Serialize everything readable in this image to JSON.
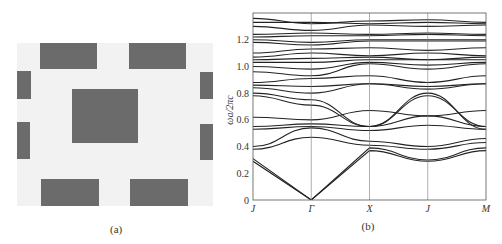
{
  "figure": {
    "panel_a": {
      "caption": "(a)",
      "description": "Unit cell of 2D photonic crystal with rectangular rods",
      "colors": {
        "background": "#f2f2f2",
        "rod": "#6b6b6b"
      },
      "rods": [
        {
          "name": "top-left",
          "x": 40,
          "y": 43,
          "w": 57,
          "h": 26
        },
        {
          "name": "top-right",
          "x": 129,
          "y": 43,
          "w": 57,
          "h": 26
        },
        {
          "name": "left-upper",
          "x": 17,
          "y": 71,
          "w": 14,
          "h": 28
        },
        {
          "name": "left-lower",
          "x": 17,
          "y": 122,
          "w": 13,
          "h": 37
        },
        {
          "name": "right-upper",
          "x": 200,
          "y": 72,
          "w": 13,
          "h": 27
        },
        {
          "name": "right-lower",
          "x": 200,
          "y": 124,
          "w": 13,
          "h": 36
        },
        {
          "name": "center",
          "x": 72,
          "y": 89,
          "w": 66,
          "h": 54
        },
        {
          "name": "bottom-left",
          "x": 41,
          "y": 179,
          "w": 58,
          "h": 27
        },
        {
          "name": "bottom-right",
          "x": 130,
          "y": 179,
          "w": 58,
          "h": 27
        }
      ]
    },
    "panel_b": {
      "caption": "(b)"
    }
  },
  "chart_data": {
    "type": "line",
    "title": "",
    "xlabel": "",
    "ylabel": "ωa/2πc",
    "categories": [
      "J",
      "Γ",
      "X",
      "J",
      "M"
    ],
    "yticks": [
      0,
      0.2,
      0.4,
      0.6,
      0.8,
      1.0,
      1.2
    ],
    "ytick_labels": [
      "0",
      "0.2",
      "0.4",
      "0.6",
      "0.8",
      "1.0",
      "1.2"
    ],
    "ylim": [
      0,
      1.4
    ],
    "grid": "vertical lines at high-symmetry points",
    "legend": "none",
    "series": [
      {
        "name": "band-1",
        "values": [
          0.29,
          0.0,
          0.37,
          0.29,
          0.37
        ]
      },
      {
        "name": "band-2",
        "values": [
          0.31,
          0.0,
          0.39,
          0.3,
          0.39
        ]
      },
      {
        "name": "band-3",
        "values": [
          0.38,
          0.47,
          0.41,
          0.38,
          0.43
        ]
      },
      {
        "name": "band-4",
        "values": [
          0.4,
          0.54,
          0.44,
          0.4,
          0.46
        ]
      },
      {
        "name": "band-5",
        "values": [
          0.53,
          0.55,
          0.52,
          0.56,
          0.53
        ]
      },
      {
        "name": "band-6",
        "values": [
          0.55,
          0.57,
          0.55,
          0.63,
          0.55
        ]
      },
      {
        "name": "band-7",
        "values": [
          0.62,
          0.6,
          0.67,
          0.63,
          0.67
        ]
      },
      {
        "name": "band-8",
        "values": [
          0.78,
          0.71,
          0.55,
          0.78,
          0.55
        ]
      },
      {
        "name": "band-9",
        "values": [
          0.8,
          0.75,
          0.55,
          0.8,
          0.53
        ]
      },
      {
        "name": "band-10",
        "values": [
          0.84,
          0.8,
          0.87,
          0.83,
          0.87
        ]
      },
      {
        "name": "band-11",
        "values": [
          0.86,
          0.85,
          0.87,
          0.85,
          0.87
        ]
      },
      {
        "name": "band-12",
        "values": [
          0.88,
          0.91,
          0.93,
          0.88,
          0.93
        ]
      },
      {
        "name": "band-13",
        "values": [
          0.96,
          0.93,
          1.02,
          0.98,
          1.02
        ]
      },
      {
        "name": "band-14",
        "values": [
          1.0,
          0.98,
          1.03,
          1.01,
          1.03
        ]
      },
      {
        "name": "band-15",
        "values": [
          1.03,
          1.03,
          1.05,
          1.05,
          1.05
        ]
      },
      {
        "name": "band-16",
        "values": [
          1.05,
          1.06,
          1.07,
          1.05,
          1.07
        ]
      },
      {
        "name": "band-17",
        "values": [
          1.07,
          1.1,
          1.08,
          1.1,
          1.08
        ]
      },
      {
        "name": "band-18",
        "values": [
          1.1,
          1.13,
          1.14,
          1.12,
          1.14
        ]
      },
      {
        "name": "band-19",
        "values": [
          1.18,
          1.16,
          1.19,
          1.19,
          1.19
        ]
      },
      {
        "name": "band-20",
        "values": [
          1.2,
          1.18,
          1.2,
          1.2,
          1.2
        ]
      },
      {
        "name": "band-21",
        "values": [
          1.22,
          1.23,
          1.23,
          1.24,
          1.23
        ]
      },
      {
        "name": "band-22",
        "values": [
          1.24,
          1.25,
          1.24,
          1.25,
          1.24
        ]
      },
      {
        "name": "band-23",
        "values": [
          1.3,
          1.27,
          1.31,
          1.3,
          1.31
        ]
      },
      {
        "name": "band-24",
        "values": [
          1.33,
          1.33,
          1.32,
          1.33,
          1.32
        ]
      },
      {
        "name": "band-25",
        "values": [
          1.36,
          1.32,
          1.34,
          1.35,
          1.33
        ]
      }
    ]
  }
}
